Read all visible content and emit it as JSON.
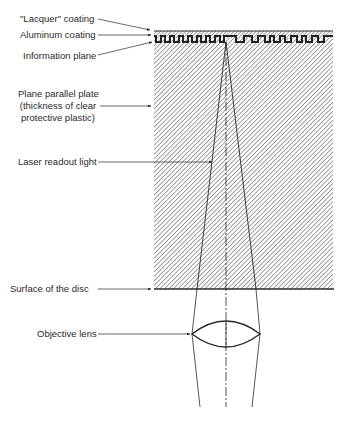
{
  "diagram": {
    "labels": {
      "lacquer": "\"Lacquer\" coating",
      "aluminum": "Aluminum coating",
      "information_plane": "Information plane",
      "plate_line1": "Plane parallel plate",
      "plate_line2": "(thickness of clear",
      "plate_line3": "protective plastic)",
      "laser": "Laser readout light",
      "surface": "Surface of the disc",
      "lens": "Objective lens"
    },
    "colors": {
      "ink": "#2a2a2a",
      "hatch": "#555555",
      "background": "#ffffff"
    },
    "geometry": {
      "disc": {
        "left": 154,
        "right": 333,
        "top": 31,
        "bottom": 289
      },
      "optical_axis_x": 226,
      "focus_point": {
        "x": 226,
        "y": 42
      },
      "lens": {
        "left_x": 192,
        "right_x": 260,
        "center_y": 334,
        "top_y": 322,
        "bottom_y": 347
      }
    }
  }
}
